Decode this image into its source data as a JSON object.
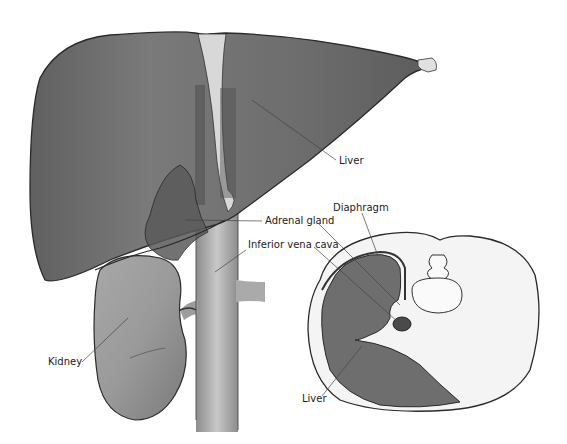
{
  "figure": {
    "left_view": "Anterior view of liver with right kidney, adrenal gland and inferior vena cava",
    "right_view": "Transverse cross-section showing liver, diaphragm and spine"
  },
  "labels": {
    "liver_top": "Liver",
    "adrenal_gland": "Adrenal gland",
    "inferior_vena_cava": "Inferior vena cava",
    "kidney": "Kidney",
    "diaphragm": "Diaphragm",
    "liver_section": "Liver"
  },
  "colors": {
    "liver_fill": "#6e6e6e",
    "liver_light": "#8a8a8a",
    "kidney_fill": "#9a9a9a",
    "vena_cava": "#b4b4b4",
    "outline": "#2a2a2a",
    "section_bg": "#f4f4f4"
  }
}
